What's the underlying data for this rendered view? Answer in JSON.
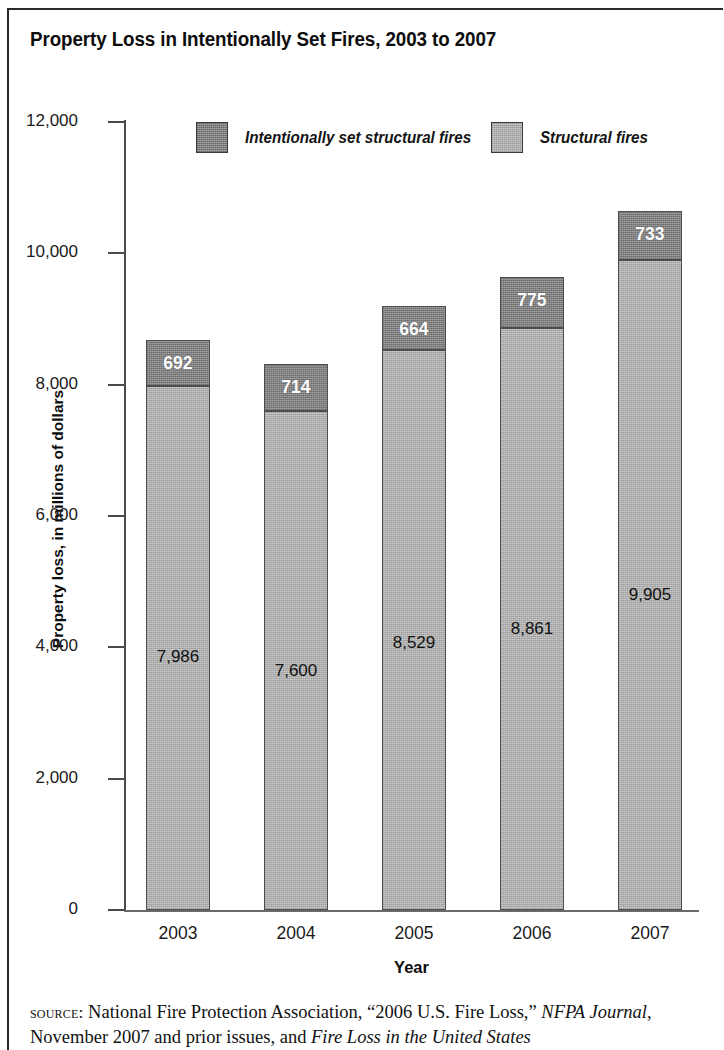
{
  "title": "Property Loss in Intentionally Set Fires, 2003 to 2007",
  "legend": {
    "intentional_label": "Intentionally set structural fires",
    "structural_label": "Structural fires"
  },
  "axes": {
    "y_title": "Property loss, in millions of dollars",
    "x_title": "Year",
    "y_ticks": [
      "12,000",
      "10,000",
      "8,000",
      "6,000",
      "4,000",
      "2,000",
      "0"
    ],
    "x_ticks": [
      "2003",
      "2004",
      "2005",
      "2006",
      "2007"
    ]
  },
  "bars": [
    {
      "year": "2003",
      "structural": "7,986",
      "intentional": "692"
    },
    {
      "year": "2004",
      "structural": "7,600",
      "intentional": "714"
    },
    {
      "year": "2005",
      "structural": "8,529",
      "intentional": "664"
    },
    {
      "year": "2006",
      "structural": "8,861",
      "intentional": "775"
    },
    {
      "year": "2007",
      "structural": "9,905",
      "intentional": "733"
    }
  ],
  "source": {
    "label": "source:",
    "text_1": " National Fire Protection Association, “2006 U.S. Fire Loss,” ",
    "italic_1": "NFPA Journal",
    "text_2": ", November 2007 and prior issues, and ",
    "italic_2": "Fire Loss in the United States"
  },
  "colors": {
    "intentional": "#8e8e8e",
    "structural": "#b6b6b6",
    "axis": "#4a4a4a",
    "text": "#111111"
  },
  "chart_data": {
    "type": "bar",
    "title": "Property Loss in Intentionally Set Fires, 2003 to 2007",
    "xlabel": "Year",
    "ylabel": "Property loss, in millions of dollars",
    "categories": [
      "2003",
      "2004",
      "2005",
      "2006",
      "2007"
    ],
    "series": [
      {
        "name": "Structural fires",
        "values": [
          7986,
          7600,
          8529,
          8861,
          9905
        ]
      },
      {
        "name": "Intentionally set structural fires",
        "values": [
          692,
          714,
          664,
          775,
          733
        ]
      }
    ],
    "totals": [
      8678,
      8314,
      9193,
      9636,
      10638
    ],
    "stacked": true,
    "ylim": [
      0,
      12000
    ],
    "yticks": [
      0,
      2000,
      4000,
      6000,
      8000,
      10000,
      12000
    ],
    "grid": false,
    "legend_position": "top"
  }
}
